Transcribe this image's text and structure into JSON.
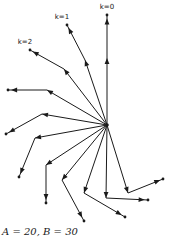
{
  "caption": "A = 20, B = 30",
  "hub": [
    107,
    125
  ],
  "labels": [
    {
      "text": "k=0",
      "x": 107,
      "y": 9
    },
    {
      "text": "k=1",
      "x": 62,
      "y": 19
    },
    {
      "text": "k=2",
      "x": 25,
      "y": 44
    }
  ],
  "paths": [
    {
      "k": 0,
      "bend": [
        107,
        58
      ],
      "end": [
        107,
        15
      ]
    },
    {
      "k": 1,
      "bend": [
        85,
        60
      ],
      "end": [
        67,
        25
      ]
    },
    {
      "k": 2,
      "bend": [
        64,
        69
      ],
      "end": [
        30,
        50
      ]
    },
    {
      "k": 3,
      "bend": [
        47,
        90
      ],
      "end": [
        8,
        90
      ]
    },
    {
      "k": 4,
      "bend": [
        42,
        114
      ],
      "end": [
        6,
        134
      ]
    },
    {
      "k": 5,
      "bend": [
        35,
        138
      ],
      "end": [
        19,
        177
      ]
    },
    {
      "k": 6,
      "bend": [
        46,
        165
      ],
      "end": [
        46,
        203
      ]
    },
    {
      "k": 7,
      "bend": [
        62,
        180
      ],
      "end": [
        84,
        221
      ]
    },
    {
      "k": 8,
      "bend": [
        84,
        193
      ],
      "end": [
        125,
        217
      ]
    },
    {
      "k": 9,
      "bend": [
        106,
        198
      ],
      "end": [
        148,
        200
      ]
    },
    {
      "k": 10,
      "bend": [
        128,
        193
      ],
      "end": [
        163,
        179
      ]
    }
  ]
}
